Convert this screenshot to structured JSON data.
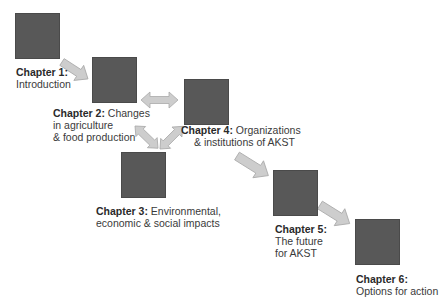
{
  "diagram": {
    "type": "flow",
    "colors": {
      "box": "#585858",
      "arrow_fill": "#cdcdcd",
      "arrow_stroke": "#a9a9a9",
      "text": "#3a3a3a"
    },
    "chapters": [
      {
        "id": "chapter-1",
        "title": "Chapter 1:",
        "lines": [
          "Introduction"
        ]
      },
      {
        "id": "chapter-2",
        "title": "Chapter 2:",
        "title_suffix": " Changes",
        "lines": [
          "in agriculture",
          "& food production"
        ]
      },
      {
        "id": "chapter-3",
        "title": "Chapter 3:",
        "title_suffix": " Environmental,",
        "lines": [
          "economic & social impacts"
        ]
      },
      {
        "id": "chapter-4",
        "title": "Chapter 4:",
        "title_suffix": " Organizations",
        "lines": [
          "& institutions of AKST"
        ]
      },
      {
        "id": "chapter-5",
        "title": "Chapter 5:",
        "lines": [
          "The future",
          "for AKST"
        ]
      },
      {
        "id": "chapter-6",
        "title": "Chapter 6:",
        "lines": [
          "Options for action"
        ]
      }
    ],
    "arrows": [
      {
        "from": "chapter-1",
        "to": "chapter-2",
        "direction": "one-way"
      },
      {
        "from": "chapter-2",
        "to": "chapter-4",
        "direction": "two-way"
      },
      {
        "from": "chapter-2",
        "to": "chapter-3",
        "direction": "two-way"
      },
      {
        "from": "chapter-3",
        "to": "chapter-4",
        "direction": "two-way"
      },
      {
        "from": "chapter-4",
        "to": "chapter-5",
        "direction": "one-way"
      },
      {
        "from": "chapter-5",
        "to": "chapter-6",
        "direction": "one-way"
      }
    ]
  }
}
